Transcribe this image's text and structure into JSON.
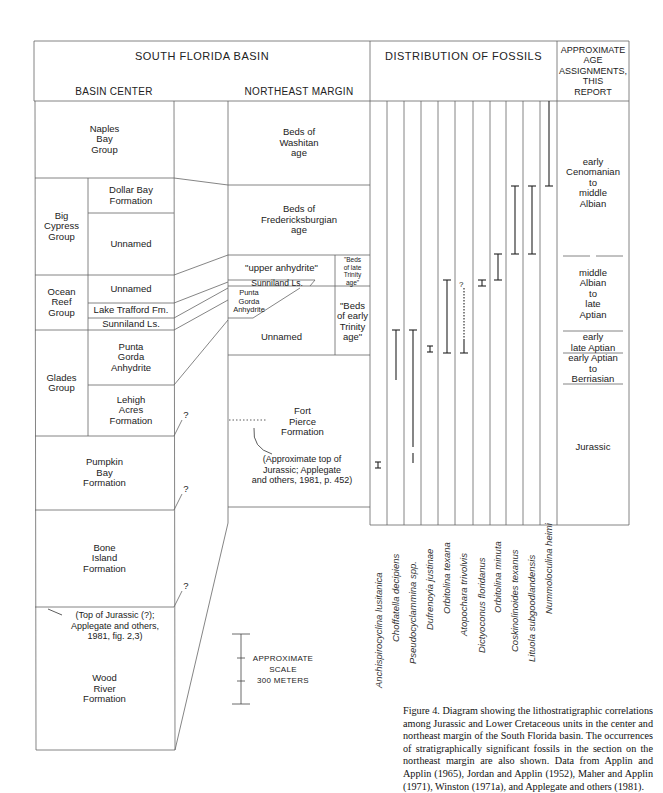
{
  "header": {
    "title": "SOUTH FLORIDA BASIN",
    "basin_center": "BASIN CENTER",
    "northeast_margin": "NORTHEAST MARGIN",
    "fossils": "DISTRIBUTION OF FOSSILS",
    "age": "APPROXIMATE\nAGE\nASSIGNMENTS,\nTHIS\nREPORT"
  },
  "basin_center": {
    "naples": "Naples\nBay\nGroup",
    "big_cypress": "Big\nCypress\nGroup",
    "dollar_bay": "Dollar Bay\nFormation",
    "unnamed_bc": "Unnamed",
    "ocean_reef": "Ocean\nReef\nGroup",
    "unnamed_or": "Unnamed",
    "lake_trafford": "Lake Trafford Fm.",
    "sunniland": "Sunniland Ls.",
    "glades": "Glades\nGroup",
    "punta_gorda": "Punta\nGorda\nAnhydrite",
    "lehigh": "Lehigh\nAcres\nFormation",
    "pumpkin_bay": "Pumpkin\nBay\nFormation",
    "bone_island": "Bone\nIsland\nFormation",
    "top_jurassic_note": "(Top of Jurassic (?);\nApplegate and others,\n1981, fig. 2,3)",
    "wood_river": "Wood\nRiver\nFormation",
    "question_marks": [
      "?",
      "?",
      "?"
    ]
  },
  "northeast_margin": {
    "washitan": "Beds of\nWashitan\nage",
    "fredericksburgian": "Beds of\nFredericksburgian\nage",
    "upper_anhydrite": "\"upper anhydrite\"",
    "late_trinity": "\"Beds\nof late\nTrinity\nage\"",
    "sunniland": "Sunniland Ls.",
    "punta_gorda": "Punta\nGorda\nAnhydrite",
    "unnamed": "Unnamed",
    "early_trinity": "\"Beds\nof early\nTrinity\nage\"",
    "fort_pierce": "Fort\nPierce\nFormation",
    "jurassic_note": "(Approximate top of\nJurassic; Applegate\nand others, 1981, p. 452)"
  },
  "fossils": [
    "Anchispirocyclina lusitanica",
    "Choffatella decipiens",
    "Pseudocyclammina spp.",
    "Dufrenoyia justinae",
    "Orbitolina texana",
    "Atopochara trivolvis",
    "Dictyoconus floridanus",
    "Orbitolina minuta",
    "Coskinolinoides texanus",
    "Lituola subgoodlandensis",
    "Nummoloculina heimi"
  ],
  "ages": {
    "a1": "early\nCenomanian\nto\nmiddle\nAlbian",
    "a2": "middle\nAlbian\nto\nlate\nAptian",
    "a3": "early\nlate Aptian",
    "a4": "early Aptian\nto\nBerriasian",
    "a5": "Jurassic"
  },
  "scale": {
    "label": "APPROXIMATE\nSCALE\n300 METERS"
  },
  "caption": "Figure 4. Diagram showing the lithostratigraphic correlations among Jurassic and Lower Cretaceous units in the center and northeast margin of the South Florida basin. The occurrences of stratigraphically significant fossils in the section on the northeast margin are also shown. Data from Applin and Applin (1965), Jordan and Applin (1952), Maher and Applin (1971), Winston (1971a), and Applegate and others (1981)."
}
